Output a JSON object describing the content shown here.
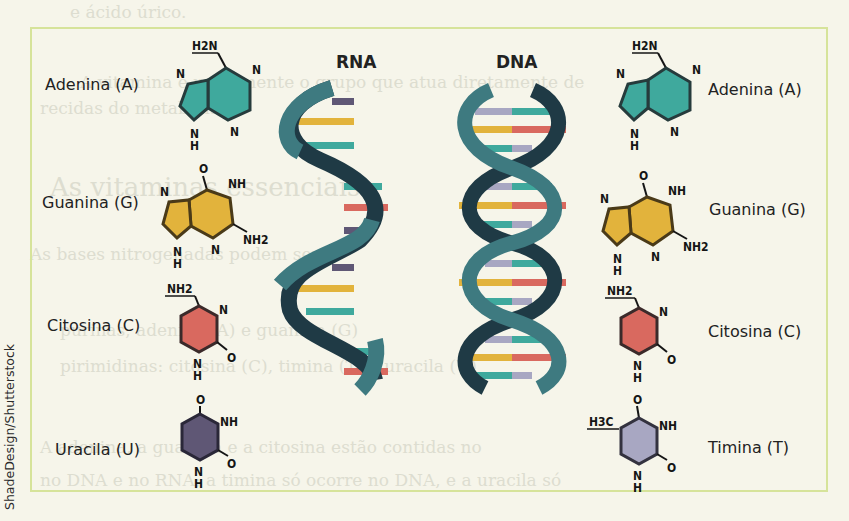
{
  "credit": "ShadeDesign/Shutterstock",
  "diagram": {
    "rna_title": "RNA",
    "dna_title": "DNA",
    "left_bases": [
      {
        "label": "Adenina (A)",
        "color": "#3fa99d"
      },
      {
        "label": "Guanina (G)",
        "color": "#e2b33c"
      },
      {
        "label": "Citosina (C)",
        "color": "#d9695f"
      },
      {
        "label": "Uracila (U)",
        "color": "#5f5775"
      }
    ],
    "right_bases": [
      {
        "label": "Adenina (A)",
        "color": "#3fa99d"
      },
      {
        "label": "Guanina (G)",
        "color": "#e2b33c"
      },
      {
        "label": "Citosina (C)",
        "color": "#d9695f"
      },
      {
        "label": "Timina (T)",
        "color": "#a8a7c2"
      }
    ],
    "atoms": {
      "h2n": "H2N",
      "n": "N",
      "h": "H",
      "o": "O",
      "nh": "NH",
      "nh2": "NH2",
      "h3c": "H3C"
    },
    "colors": {
      "strand_light": "#3e7a80",
      "strand_dark": "#1f3a45",
      "frame_border": "#d6e39a",
      "background": "#f6f5ea"
    }
  },
  "show_through_text": [
    "e ácido úrico.",
    "A vitamina é unicamente o grupo que atua diretamente de",
    "recidas do metabolismo",
    "As vitaminas essenciais",
    "As bases nitrogenadas podem ser",
    "purinas, adenina (A) e guanina (G)",
    "pirimidinas: citosina (C), timina (T) e uracila (U)",
    "A adenina, a guanina e a citosina estão contidas no",
    "no DNA e no RNA; a timina só ocorre no DNA, e a uracila só"
  ]
}
